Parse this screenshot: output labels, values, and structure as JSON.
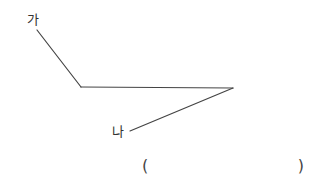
{
  "diagram": {
    "type": "broken-line",
    "stroke_color": "#444444",
    "points": {
      "ga": {
        "label": "가",
        "x": 37,
        "y": 30
      },
      "vertex_left": {
        "x": 81,
        "y": 87
      },
      "vertex_right": {
        "x": 233,
        "y": 88
      },
      "na": {
        "label": "나",
        "x": 130,
        "y": 131
      }
    },
    "segments": [
      {
        "from": "ga",
        "to": "vertex_left"
      },
      {
        "from": "vertex_left",
        "to": "vertex_right"
      },
      {
        "from": "vertex_right",
        "to": "na"
      }
    ]
  },
  "labels": {
    "start": "가",
    "end": "나"
  },
  "answer": {
    "open_paren": "(",
    "close_paren": ")",
    "value": ""
  }
}
